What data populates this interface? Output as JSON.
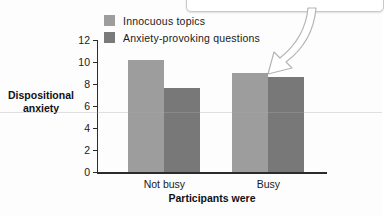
{
  "chart_data": {
    "type": "bar",
    "title": "",
    "xlabel": "Participants were",
    "ylabel": "Dispositional anxiety",
    "categories": [
      "Not busy",
      "Busy"
    ],
    "series": [
      {
        "name": "Innocuous topics",
        "color": "#9d9d9d",
        "values": [
          10.2,
          9.0
        ]
      },
      {
        "name": "Anxiety-provoking questions",
        "color": "#787878",
        "values": [
          7.6,
          8.6
        ]
      }
    ],
    "ylim": [
      0,
      12
    ],
    "ytick_values": [
      0,
      2,
      4,
      6,
      8,
      10,
      12
    ],
    "ytick_labels": [
      "0",
      "2",
      "4",
      "6",
      "8",
      "10",
      "12"
    ],
    "grid": false,
    "legend_position": "top-left"
  },
  "annotations": {
    "callout_box_text": "",
    "arrow_name": "curved-callout-arrow"
  }
}
